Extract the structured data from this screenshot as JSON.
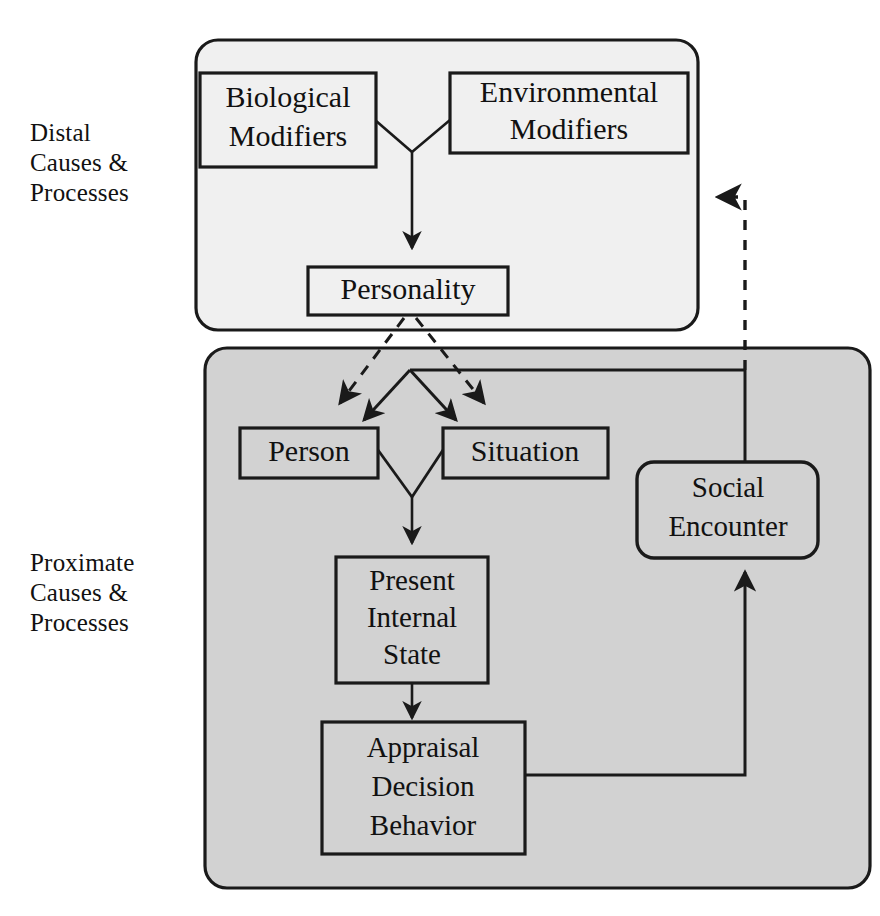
{
  "figure": {
    "type": "flow-diagram",
    "background": "#ffffff"
  },
  "colors": {
    "panel_distal_fill": "#f0f0f0",
    "panel_proximate_fill": "#d2d2d2",
    "node_fill_distal": "#f0f0f0",
    "node_fill_proximate": "#d2d2d2",
    "stroke": "#1a1a1a",
    "text": "#111111"
  },
  "side_labels": {
    "distal": "Distal\nCauses &\nProcesses",
    "proximate": "Proximate\nCauses &\nProcesses"
  },
  "panels": [
    {
      "id": "distal-panel",
      "name": "distal-panel",
      "label": "Distal Causes & Processes"
    },
    {
      "id": "proximate-panel",
      "name": "proximate-panel",
      "label": "Proximate Causes & Processes"
    }
  ],
  "nodes": {
    "biological_modifiers": {
      "lines": [
        "Biological",
        "Modifiers"
      ],
      "shape": "rect"
    },
    "environmental_modifiers": {
      "lines": [
        "Environmental",
        "Modifiers"
      ],
      "shape": "rect"
    },
    "personality": {
      "lines": [
        "Personality"
      ],
      "shape": "rect"
    },
    "person": {
      "lines": [
        "Person"
      ],
      "shape": "rect"
    },
    "situation": {
      "lines": [
        "Situation"
      ],
      "shape": "rect"
    },
    "present_internal_state": {
      "lines": [
        "Present",
        "Internal",
        "State"
      ],
      "shape": "rect"
    },
    "appraisal_decision_behavior": {
      "lines": [
        "Appraisal",
        "Decision",
        "Behavior"
      ],
      "shape": "rect"
    },
    "social_encounter": {
      "lines": [
        "Social",
        "Encounter"
      ],
      "shape": "rounded-rect"
    }
  },
  "edges": [
    {
      "name": "modifiers-to-personality",
      "from": "biological_modifiers + environmental_modifiers",
      "to": "personality",
      "style": "solid",
      "arrow": "single"
    },
    {
      "name": "personality-to-person",
      "from": "personality",
      "to": "person",
      "style": "dashed",
      "arrow": "single"
    },
    {
      "name": "personality-to-situation",
      "from": "personality",
      "to": "situation",
      "style": "dashed",
      "arrow": "single"
    },
    {
      "name": "social-encounter-to-person",
      "from": "social_encounter",
      "to": "person",
      "style": "solid",
      "arrow": "single"
    },
    {
      "name": "social-encounter-to-situation",
      "from": "social_encounter",
      "to": "situation",
      "style": "solid",
      "arrow": "single"
    },
    {
      "name": "person-situation-to-present-internal-state",
      "from": "person + situation",
      "to": "present_internal_state",
      "style": "solid",
      "arrow": "single"
    },
    {
      "name": "present-internal-state-to-appraisal",
      "from": "present_internal_state",
      "to": "appraisal_decision_behavior",
      "style": "solid",
      "arrow": "single"
    },
    {
      "name": "appraisal-to-social-encounter",
      "from": "appraisal_decision_behavior",
      "to": "social_encounter",
      "style": "solid",
      "arrow": "single"
    },
    {
      "name": "proximate-feedback-to-distal",
      "from": "proximate-panel",
      "to": "distal-panel",
      "style": "dashed",
      "arrow": "single"
    }
  ]
}
